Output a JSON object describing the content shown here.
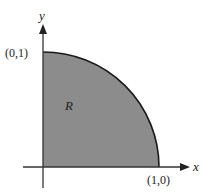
{
  "figure": {
    "type": "quarter-disk region",
    "region_label": "R",
    "x_axis_label": "x",
    "y_axis_label": "y",
    "point_y_intercept": "(0,1)",
    "point_x_intercept": "(1,0)",
    "colors": {
      "fill": "#8c8c8c",
      "stroke": "#1a1a1a",
      "axis": "#333333",
      "text": "#222222"
    }
  }
}
